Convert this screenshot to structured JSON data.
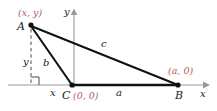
{
  "figure": {
    "type": "geometry-diagram",
    "colors": {
      "stroke": "#1a1a1a",
      "axis": "#9a9a9a",
      "label_red": "#b9585a",
      "background": "#ffffff"
    },
    "axes": {
      "x_label": "x",
      "y_label": "y"
    },
    "vertices": [
      {
        "name": "A",
        "coord_label": "(x, y)",
        "px": [
          31,
          25
        ]
      },
      {
        "name": "B",
        "coord_label": "(a, 0)",
        "px": [
          178,
          85
        ]
      },
      {
        "name": "C",
        "coord_label": "(0, 0)",
        "px": [
          72,
          85
        ]
      }
    ],
    "sides": [
      {
        "name": "a",
        "from": "C",
        "to": "B"
      },
      {
        "name": "b",
        "from": "C",
        "to": "A"
      },
      {
        "name": "c",
        "from": "A",
        "to": "B"
      }
    ],
    "drop_labels": [
      {
        "name": "y",
        "meaning": "vertical distance from A to x-axis"
      },
      {
        "name": "x",
        "meaning": "horizontal distance from foot of perpendicular to C"
      }
    ],
    "markers": {
      "right_angle": "right-angle-square"
    }
  }
}
